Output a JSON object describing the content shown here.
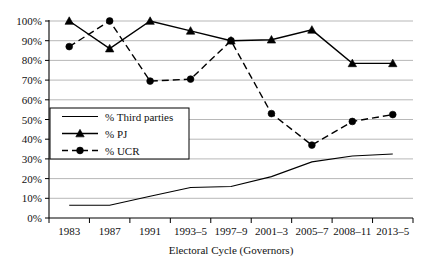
{
  "chart_data": {
    "type": "line",
    "title": "",
    "xlabel": "Electoral Cycle (Governors)",
    "ylabel": "",
    "categories": [
      "1983",
      "1987",
      "1991",
      "1993–5",
      "1997–9",
      "2001–3",
      "2005–7",
      "2008–11",
      "2013–5"
    ],
    "ylim": [
      0,
      100
    ],
    "ytick_labels": [
      "0%",
      "10%",
      "20%",
      "30%",
      "40%",
      "50%",
      "60%",
      "70%",
      "80%",
      "90%",
      "100%"
    ],
    "ytick_values": [
      0,
      10,
      20,
      30,
      40,
      50,
      60,
      70,
      80,
      90,
      100
    ],
    "grid": true,
    "grid_axis": "y",
    "legend_position": "inside-lower-left",
    "series": [
      {
        "name": "% Third parties",
        "values": [
          6.5,
          6.5,
          11,
          15.5,
          16,
          21,
          28.5,
          31.5,
          32.5
        ],
        "style": "solid",
        "marker": "none",
        "color": "#000000"
      },
      {
        "name": "% PJ",
        "values": [
          100,
          86,
          100,
          95,
          90,
          90.5,
          95.5,
          78.5,
          78.5
        ],
        "style": "solid",
        "marker": "triangle",
        "color": "#000000"
      },
      {
        "name": "% UCR",
        "values": [
          87,
          100,
          69.5,
          70.5,
          90,
          53,
          37,
          49,
          52.5
        ],
        "style": "dashed",
        "marker": "circle",
        "color": "#000000"
      }
    ]
  }
}
